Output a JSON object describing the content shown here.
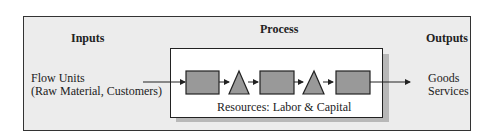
{
  "diagram": {
    "inputs_heading": "Inputs",
    "process_heading": "Process",
    "outputs_heading": "Outputs",
    "inputs_lines": [
      "Flow Units",
      "(Raw Material, Customers)"
    ],
    "outputs_lines": [
      "Goods",
      "Services"
    ],
    "resources_label": "Resources: Labor & Capital",
    "flow_sequence": [
      "activity-box",
      "buffer-triangle",
      "activity-box",
      "buffer-triangle",
      "activity-box"
    ],
    "colors": {
      "panel": "#ececec",
      "shape_fill": "#999999",
      "border": "#222222"
    }
  }
}
